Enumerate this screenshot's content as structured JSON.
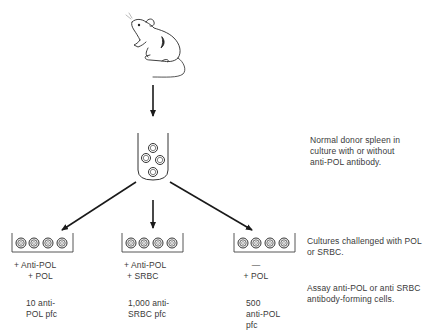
{
  "diagram": {
    "colors": {
      "stroke": "#1a1a1a",
      "text": "#3a3a3a",
      "background": "#ffffff"
    },
    "source": {
      "icon": "mouse-icon",
      "label": ""
    },
    "tube": {
      "icon": "culture-tube-icon",
      "cells": 4
    },
    "annotations": {
      "step1": {
        "line1": "Normal donor spleen in",
        "line2": "culture with or without",
        "line3": "anti-POL antibody."
      },
      "step2": {
        "line1": "Cultures challenged with POL",
        "line2": "or SRBC."
      },
      "step3": {
        "line1": "Assay anti-POL or anti SRBC",
        "line2": "antibody-forming cells."
      }
    },
    "branches": [
      {
        "plate": {
          "icon": "well-plate-icon",
          "wells": 4
        },
        "treatment": {
          "line1": "+ Anti-POL",
          "line2": "+ POL"
        },
        "result": {
          "line1": "10 anti-",
          "line2": "POL pfc",
          "line3": ""
        }
      },
      {
        "plate": {
          "icon": "well-plate-icon",
          "wells": 4
        },
        "treatment": {
          "line1": "+ Anti-POL",
          "line2": "+ SRBC"
        },
        "result": {
          "line1": "1,000 anti-",
          "line2": "SRBC pfc",
          "line3": ""
        }
      },
      {
        "plate": {
          "icon": "well-plate-icon",
          "wells": 4
        },
        "treatment": {
          "line1": "—",
          "line2": "+ POL"
        },
        "result": {
          "line1": "500",
          "line2": "anti-POL",
          "line3": "pfc"
        }
      }
    ]
  }
}
